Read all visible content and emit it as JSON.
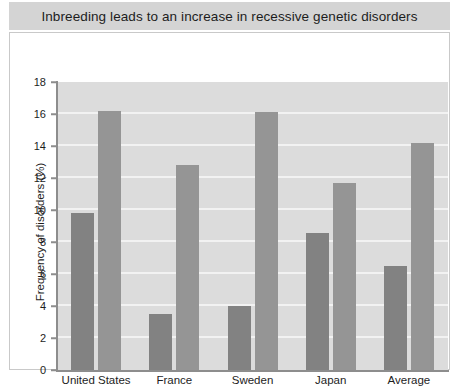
{
  "title": "Inbreeding leads to an increase in recessive genetic disorders",
  "colors": {
    "banner_bg": "#d4d4d4",
    "plot_bg": "#dcdcdc",
    "gridline": "#f2f2f2",
    "axis": "#8d8d8d",
    "series_1": "#828282",
    "series_2": "#959595",
    "text": "#1d1d1d"
  },
  "chart_data": {
    "type": "bar",
    "title": "Inbreeding leads to an increase in recessive genetic disorders",
    "xlabel": "",
    "ylabel": "Frequency of disorders (%)",
    "categories": [
      "United States",
      "France",
      "Sweden",
      "Japan",
      "Average"
    ],
    "series": [
      {
        "name": "series-1",
        "values": [
          9.8,
          3.5,
          4.0,
          8.55,
          6.5
        ]
      },
      {
        "name": "series-2",
        "values": [
          16.2,
          12.8,
          16.1,
          11.7,
          14.2
        ]
      }
    ],
    "ylim": [
      0,
      18
    ],
    "yticks": [
      0,
      2,
      4,
      6,
      8,
      10,
      12,
      14,
      16,
      18
    ],
    "ytick_labels": [
      "0",
      "2",
      "4",
      "6",
      "8",
      "10",
      "12",
      "14",
      "16",
      "18"
    ],
    "grid": true,
    "legend": false,
    "legend_position": "none"
  }
}
